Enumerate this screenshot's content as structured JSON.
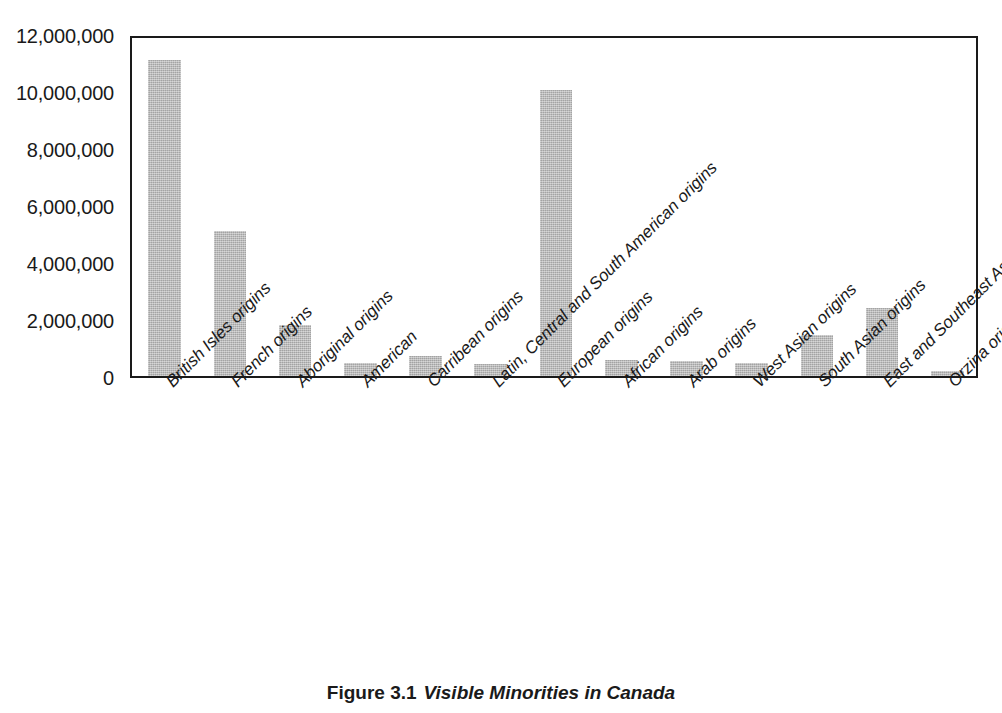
{
  "caption": {
    "number": "Figure 3.1",
    "title": "Visible Minorities in Canada"
  },
  "chart_data": {
    "type": "bar",
    "title": "Visible Minorities in Canada",
    "xlabel": "",
    "ylabel": "",
    "ylim": [
      0,
      12000000
    ],
    "yticks": [
      0,
      2000000,
      4000000,
      6000000,
      8000000,
      10000000,
      12000000
    ],
    "ytick_labels": [
      "0",
      "2,000,000",
      "4,000,000",
      "6,000,000",
      "8,000,000",
      "10,000,000",
      "12,000,000"
    ],
    "grid": false,
    "legend": null,
    "bar_color": "#b4b4b4",
    "axis_color": "#1a1a1a",
    "categories": [
      "British Isles origins",
      "French origins",
      "Aboriginal origins",
      "American",
      "Carribean origins",
      "Latin, Central and South American origins",
      "European origins",
      "African origins",
      "Arab origins",
      "West Asian origins",
      "South Asian origins",
      "East and Southeast Asian origins",
      "Orzina origins"
    ],
    "values": [
      11100000,
      5100000,
      1800000,
      450000,
      700000,
      420000,
      10050000,
      570000,
      530000,
      440000,
      1450000,
      2400000,
      190000
    ]
  }
}
